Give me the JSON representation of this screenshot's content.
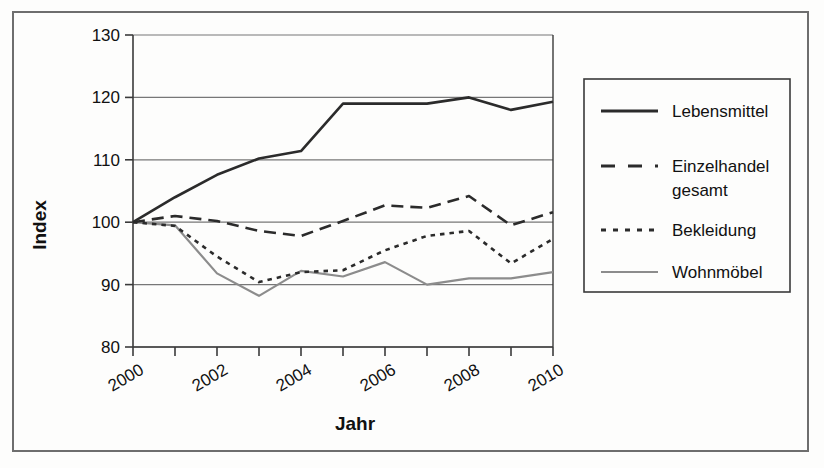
{
  "chart_data": {
    "type": "line",
    "title": "",
    "xlabel": "Jahr",
    "ylabel": "Index",
    "x": [
      2000,
      2001,
      2002,
      2003,
      2004,
      2005,
      2006,
      2007,
      2008,
      2009,
      2010
    ],
    "xtick_labels": [
      "2000",
      "2002",
      "2004",
      "2006",
      "2008",
      "2010"
    ],
    "xtick_values": [
      2000,
      2002,
      2004,
      2006,
      2008,
      2010
    ],
    "ytick_labels": [
      "80",
      "90",
      "100",
      "110",
      "120",
      "130"
    ],
    "ytick_values": [
      80,
      90,
      100,
      110,
      120,
      130
    ],
    "ylim": [
      80,
      130
    ],
    "xlim": [
      2000,
      2010
    ],
    "grid": "horizontal",
    "legend_position": "right",
    "series": [
      {
        "name": "Lebensmittel",
        "style": "solid",
        "color": "#2b2b2b",
        "width": 2.6,
        "values": [
          100.0,
          104.0,
          107.6,
          110.2,
          111.4,
          119.0,
          119.0,
          119.0,
          120.0,
          118.0,
          119.3
        ]
      },
      {
        "name": "Einzelhandel gesamt",
        "style": "dashed",
        "color": "#2b2b2b",
        "width": 2.6,
        "values": [
          100.0,
          101.0,
          100.2,
          98.6,
          97.8,
          100.2,
          102.7,
          102.3,
          104.2,
          99.5,
          101.6
        ]
      },
      {
        "name": "Bekleidung",
        "style": "dotted",
        "color": "#2b2b2b",
        "width": 2.6,
        "values": [
          100.0,
          99.4,
          94.5,
          90.4,
          92.0,
          92.3,
          95.5,
          97.8,
          98.6,
          93.4,
          97.3
        ]
      },
      {
        "name": "Wohnmöbel",
        "style": "solid",
        "color": "#8c8c8c",
        "width": 2.2,
        "values": [
          100.0,
          99.5,
          91.8,
          88.2,
          92.2,
          91.3,
          93.6,
          90.0,
          91.0,
          91.0,
          92.0
        ]
      }
    ]
  },
  "legend": {
    "items": [
      {
        "label": "Lebensmittel",
        "style": "solid",
        "color": "#2b2b2b"
      },
      {
        "label": "Einzelhandel",
        "label2": "gesamt",
        "style": "dashed",
        "color": "#2b2b2b"
      },
      {
        "label": "Bekleidung",
        "style": "dotted",
        "color": "#2b2b2b"
      },
      {
        "label": "Wohnmöbel",
        "style": "solid-gray",
        "color": "#8c8c8c"
      }
    ]
  },
  "colors": {
    "frame": "#6e6e6e",
    "axis": "#3a3a3a",
    "grid": "#777777",
    "dark_series": "#2b2b2b",
    "gray_series": "#8c8c8c",
    "text": "#111111",
    "background": "#fdfdfc"
  }
}
